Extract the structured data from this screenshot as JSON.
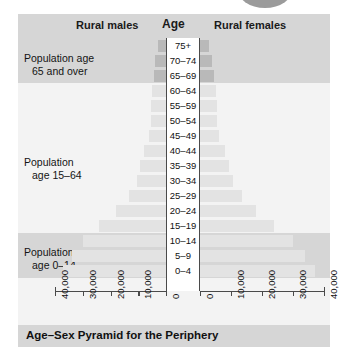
{
  "figure": {
    "caption": "Age–Sex Pyramid for the Periphery",
    "columns": {
      "left_title": "Rural males",
      "center_title": "Age",
      "right_title": "Rural females"
    },
    "band_annotations": [
      {
        "line1": "Population age",
        "line2": "65 and over"
      },
      {
        "line1": "Population",
        "line2": "age 15–64"
      },
      {
        "line1": "Population",
        "line2": "age 0–14"
      }
    ]
  },
  "chart_data": {
    "type": "bar",
    "subtype": "population-pyramid",
    "title": "Age–Sex Pyramid for the Periphery",
    "xlabel": "",
    "ylabel": "Age",
    "orientation": "horizontal",
    "xlim": [
      0,
      40000
    ],
    "grid": false,
    "legend_position": "top",
    "tick_values": [
      40000,
      30000,
      20000,
      10000,
      0
    ],
    "left_tick_labels": [
      "40,000",
      "30,000",
      "20,000",
      "10,000",
      "0"
    ],
    "right_tick_labels": [
      "0",
      "10,000",
      "20,000",
      "30,000",
      "40,000"
    ],
    "categories": [
      "75+",
      "70–74",
      "65–69",
      "60–64",
      "55–59",
      "50–54",
      "45–49",
      "40–44",
      "35–39",
      "30–34",
      "25–29",
      "20–24",
      "15–19",
      "10–14",
      "5–9",
      "0–4"
    ],
    "series": [
      {
        "name": "Rural males",
        "side": "left",
        "values": [
          3000,
          4000,
          4500,
          5000,
          5500,
          5500,
          6000,
          8000,
          9500,
          10500,
          13500,
          18000,
          24000,
          30000,
          34000,
          37000
        ]
      },
      {
        "name": "Rural females",
        "side": "right",
        "values": [
          3000,
          4000,
          4500,
          5000,
          5500,
          5500,
          6000,
          8000,
          9500,
          10500,
          13500,
          18000,
          24000,
          30000,
          34000,
          37000
        ]
      }
    ],
    "bands": [
      {
        "label": "Population age 65 and over",
        "categories": [
          "75+",
          "70–74",
          "65–69"
        ]
      },
      {
        "label": "Population age 15–64",
        "categories": [
          "60–64",
          "55–59",
          "50–54",
          "45–49",
          "40–44",
          "35–39",
          "30–34",
          "25–29",
          "20–24",
          "15–19"
        ]
      },
      {
        "label": "Population age 0–14",
        "categories": [
          "10–14",
          "5–9",
          "0–4"
        ]
      }
    ]
  },
  "colors": {
    "panel": "#f3f3f3",
    "band": "#d6d6d6",
    "bar": "#e3e3e3",
    "bar_dark": "#b9b9b9",
    "axis": "#4a4a4a",
    "text": "#111111"
  }
}
